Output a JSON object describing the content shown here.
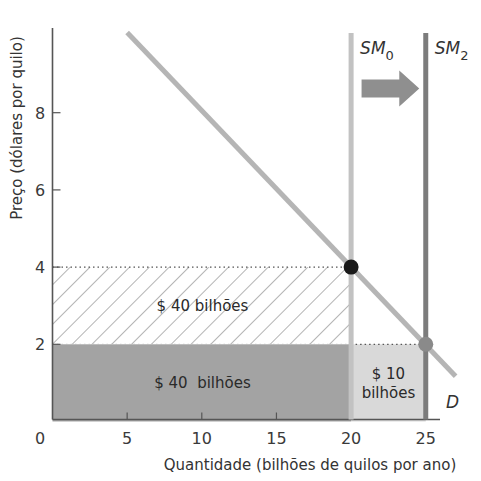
{
  "chart_data": {
    "type": "line",
    "title": "",
    "xlabel": "Quantidade (bilhões de quilos por ano)",
    "ylabel": "Preço (dólares por quilo)",
    "xlim": [
      0,
      28
    ],
    "ylim": [
      0,
      10
    ],
    "x_ticks": [
      0,
      5,
      10,
      15,
      20,
      25
    ],
    "y_ticks": [
      2,
      4,
      6,
      8
    ],
    "grid": false,
    "series": [
      {
        "name": "D",
        "kind": "demand",
        "points": [
          [
            5,
            10
          ],
          [
            27,
            1.25
          ]
        ],
        "color": "#b5b5b5"
      },
      {
        "name": "SM0",
        "label_main": "SM",
        "label_sub": "0",
        "kind": "vertical-supply",
        "x": 20,
        "color": "#c2c2c2"
      },
      {
        "name": "SM2",
        "label_main": "SM",
        "label_sub": "2",
        "kind": "vertical-supply",
        "x": 25,
        "color": "#7c7c7c"
      }
    ],
    "points": [
      {
        "name": "equilibrium-0",
        "x": 20,
        "y": 4,
        "color": "#1a1a1a"
      },
      {
        "name": "equilibrium-2",
        "x": 25,
        "y": 2,
        "color": "#8a8a8a"
      }
    ],
    "areas": [
      {
        "name": "hatched-revenue",
        "x0": 0,
        "x1": 20,
        "y0": 2,
        "y1": 4,
        "fill": "hatch",
        "label": "$ 40 bilhões"
      },
      {
        "name": "dark-revenue",
        "x0": 0,
        "x1": 20,
        "y0": 0,
        "y1": 2,
        "fill": "#a3a3a3",
        "label": "$ 40  bilhões"
      },
      {
        "name": "light-revenue",
        "x0": 20,
        "x1": 25,
        "y0": 0,
        "y1": 2,
        "fill": "#d9d9d9",
        "label_lines": [
          "$ 10",
          "bilhões"
        ]
      }
    ],
    "guides": [
      {
        "name": "price-4-guide",
        "y": 4,
        "x0": 0,
        "x1": 20
      },
      {
        "name": "price-2-guide",
        "y": 2,
        "x0": 20,
        "x1": 25
      }
    ],
    "annotations": [
      {
        "name": "shift-arrow",
        "from_x": 20.5,
        "to_x": 24.7,
        "y": 8.5,
        "text": "",
        "color": "#8f8f8f"
      }
    ]
  }
}
